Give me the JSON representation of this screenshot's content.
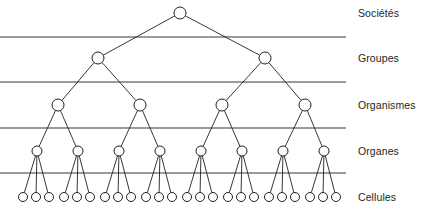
{
  "figure": {
    "type": "hierarchy-tree-diagram",
    "orientation": "top-down",
    "background_color": "#ffffff",
    "stroke_color": "#231f20",
    "node_fill_color": "#ffffff",
    "divider_color": "#231f20",
    "width": 436,
    "height": 211
  },
  "levels": [
    {
      "id": "societes",
      "label": "Sociétés",
      "label_y": 13,
      "node_y": 13,
      "node_count": 1,
      "node_radius": 6,
      "node_xs": [
        180
      ]
    },
    {
      "id": "groupes",
      "label": "Groupes",
      "label_y": 58,
      "node_y": 58,
      "node_count": 2,
      "node_radius": 6,
      "node_xs": [
        98,
        265
      ]
    },
    {
      "id": "organismes",
      "label": "Organismes",
      "label_y": 105,
      "node_y": 105,
      "node_count": 4,
      "node_radius": 6,
      "node_xs": [
        58,
        140,
        222,
        305
      ]
    },
    {
      "id": "organes",
      "label": "Organes",
      "label_y": 151,
      "node_y": 151,
      "node_count": 8,
      "node_radius": 5,
      "node_xs": [
        37,
        78,
        119,
        160,
        201,
        242,
        283,
        324
      ]
    },
    {
      "id": "cellules",
      "label": "Cellules",
      "label_y": 197,
      "node_y": 197,
      "node_count": 24,
      "node_radius": 4.5,
      "node_xs": [
        23,
        36,
        49,
        64,
        77,
        90,
        105,
        118,
        131,
        146,
        159,
        172,
        187,
        200,
        213,
        228,
        241,
        254,
        269,
        282,
        295,
        310,
        323,
        336
      ]
    }
  ],
  "dividers": {
    "x_start": 0,
    "x_end": 346,
    "ys": [
      37,
      82,
      128,
      173
    ]
  },
  "edges": {
    "note": "each parent connects to its children in the level below; cells attach in groups of three to each organ"
  }
}
